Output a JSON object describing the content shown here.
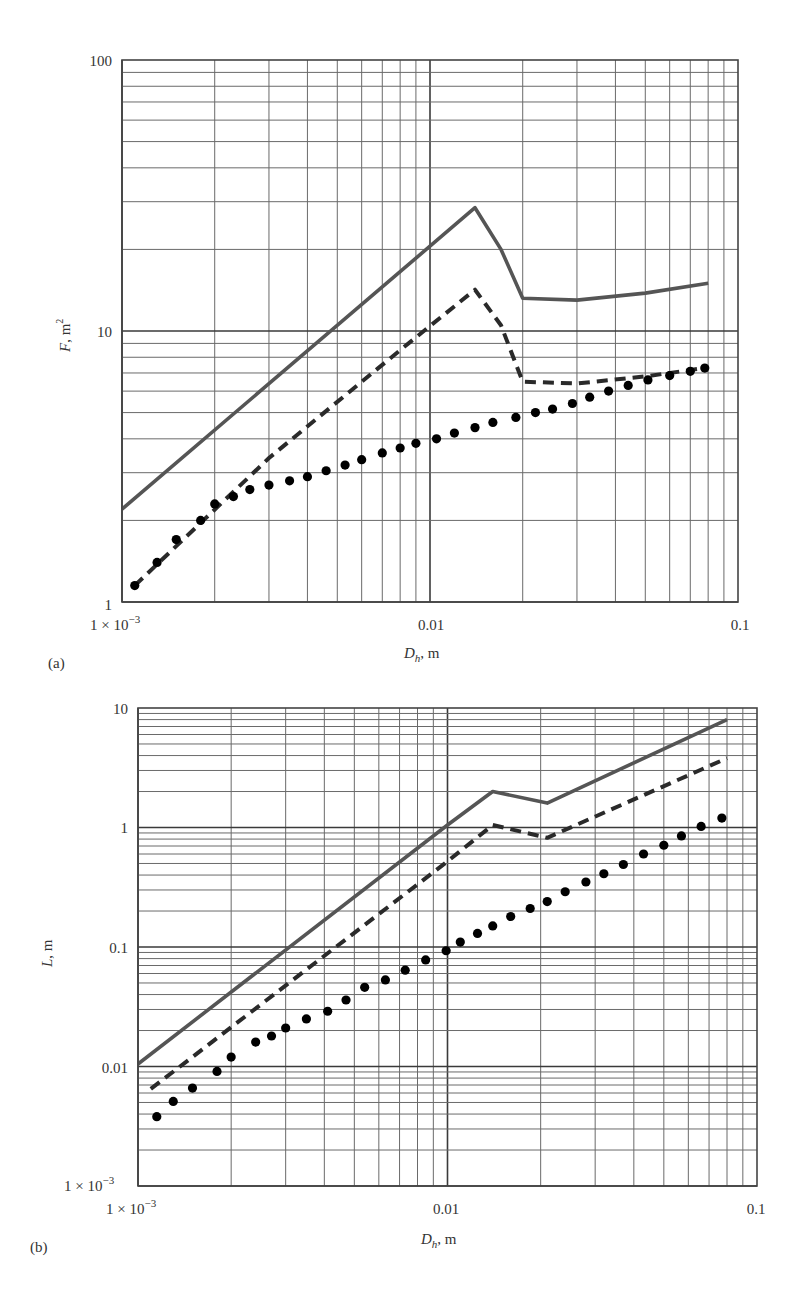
{
  "chart_data": [
    {
      "panel": "(a)",
      "type": "line",
      "xscale": "log",
      "yscale": "log",
      "xlabel": "D_h, m",
      "ylabel": "F, m²",
      "xlim": [
        0.001,
        0.1
      ],
      "ylim": [
        1,
        100
      ],
      "xticks": [
        "1 × 10⁻³",
        "0.01",
        "0.1"
      ],
      "yticks": [
        "1",
        "10",
        "100"
      ],
      "grid": true,
      "legend": null,
      "series": [
        {
          "name": "solid",
          "style": "solid",
          "x": [
            0.001,
            0.014,
            0.017,
            0.02,
            0.03,
            0.05,
            0.08
          ],
          "y": [
            2.2,
            28.5,
            20.0,
            13.2,
            13.0,
            13.8,
            15.0
          ]
        },
        {
          "name": "dashed",
          "style": "dashed",
          "x": [
            0.0011,
            0.003,
            0.008,
            0.014,
            0.017,
            0.02,
            0.03,
            0.05,
            0.078
          ],
          "y": [
            1.15,
            3.4,
            8.5,
            14.2,
            10.5,
            6.5,
            6.4,
            6.8,
            7.3
          ]
        },
        {
          "name": "dotted",
          "style": "dotted",
          "x": [
            0.0011,
            0.0013,
            0.0015,
            0.0018,
            0.002,
            0.0023,
            0.0026,
            0.003,
            0.0035,
            0.004,
            0.0046,
            0.0053,
            0.006,
            0.007,
            0.008,
            0.009,
            0.0105,
            0.012,
            0.014,
            0.016,
            0.019,
            0.022,
            0.025,
            0.029,
            0.033,
            0.038,
            0.044,
            0.051,
            0.06,
            0.07,
            0.078
          ],
          "y": [
            1.15,
            1.4,
            1.7,
            2.0,
            2.3,
            2.45,
            2.6,
            2.7,
            2.8,
            2.9,
            3.05,
            3.2,
            3.35,
            3.55,
            3.7,
            3.85,
            4.0,
            4.2,
            4.4,
            4.6,
            4.8,
            5.0,
            5.15,
            5.4,
            5.7,
            6.0,
            6.3,
            6.6,
            6.85,
            7.1,
            7.3
          ]
        }
      ]
    },
    {
      "panel": "(b)",
      "type": "line",
      "xscale": "log",
      "yscale": "log",
      "xlabel": "D_h, m",
      "ylabel": "L, m",
      "xlim": [
        0.001,
        0.1
      ],
      "ylim": [
        0.001,
        10
      ],
      "xticks": [
        "1 × 10⁻³",
        "0.01",
        "0.1"
      ],
      "yticks": [
        "1 × 10⁻³",
        "0.01",
        "0.1",
        "1",
        "10"
      ],
      "grid": true,
      "legend": null,
      "series": [
        {
          "name": "solid",
          "style": "solid",
          "x": [
            0.001,
            0.01,
            0.014,
            0.021,
            0.08
          ],
          "y": [
            0.0105,
            1.05,
            2.0,
            1.6,
            8.0
          ]
        },
        {
          "name": "dashed",
          "style": "dashed",
          "x": [
            0.0011,
            0.01,
            0.014,
            0.021,
            0.08
          ],
          "y": [
            0.0065,
            0.52,
            1.05,
            0.82,
            3.8
          ]
        },
        {
          "name": "dotted",
          "style": "dotted",
          "x": [
            0.00115,
            0.0013,
            0.0015,
            0.0018,
            0.002,
            0.0024,
            0.0027,
            0.003,
            0.0035,
            0.0041,
            0.0047,
            0.0054,
            0.0063,
            0.0073,
            0.0085,
            0.0099,
            0.011,
            0.0125,
            0.014,
            0.016,
            0.0185,
            0.021,
            0.024,
            0.028,
            0.032,
            0.037,
            0.043,
            0.05,
            0.057,
            0.066,
            0.077
          ],
          "y": [
            0.0038,
            0.0051,
            0.0066,
            0.0091,
            0.012,
            0.016,
            0.018,
            0.021,
            0.025,
            0.029,
            0.036,
            0.046,
            0.053,
            0.064,
            0.078,
            0.093,
            0.11,
            0.13,
            0.15,
            0.18,
            0.21,
            0.24,
            0.29,
            0.35,
            0.41,
            0.49,
            0.6,
            0.71,
            0.85,
            1.02,
            1.2
          ]
        }
      ]
    }
  ],
  "panels": {
    "a": {
      "label": "(a)",
      "ylabel_var": "F",
      "ylabel_unit": ", m",
      "ylabel_sup": "2",
      "xlabel_var": "D",
      "xlabel_sub": "h",
      "xlabel_unit": ", m",
      "ytick_100": "100",
      "ytick_10": "10",
      "ytick_1": "1",
      "xtick_1e3": "1 × 10",
      "xtick_1e3_exp": "−3",
      "xtick_001": "0.01",
      "xtick_01": "0.1"
    },
    "b": {
      "label": "(b)",
      "ylabel_var": "L",
      "ylabel_unit": ", m",
      "xlabel_var": "D",
      "xlabel_sub": "h",
      "xlabel_unit": ", m",
      "ytick_10": "10",
      "ytick_1": "1",
      "ytick_01": "0.1",
      "ytick_001": "0.01",
      "ytick_1e3": "1 × 10",
      "ytick_1e3_exp": "−3",
      "xtick_1e3": "1 × 10",
      "xtick_1e3_exp": "−3",
      "xtick_001": "0.01",
      "xtick_01": "0.1"
    }
  },
  "colors": {
    "grid": "#6a6a6a",
    "major_grid": "#3a3a3a",
    "solid_line": "#555555",
    "dashed_line": "#2a2a2a",
    "dots": "#000000"
  }
}
